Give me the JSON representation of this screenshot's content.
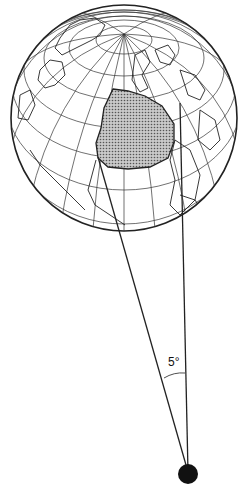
{
  "diagram": {
    "title": "",
    "angle_label": "5°",
    "globe": {
      "center": [
        124,
        118
      ],
      "radius": 113,
      "pole": [
        124,
        34
      ]
    },
    "shaded_region": "Europe and Mediterranean",
    "observer": {
      "position": [
        188,
        474
      ],
      "radius": 10
    },
    "colors": {
      "line": "#222222",
      "shade": "#9a9a9a",
      "background": "#ffffff"
    }
  }
}
